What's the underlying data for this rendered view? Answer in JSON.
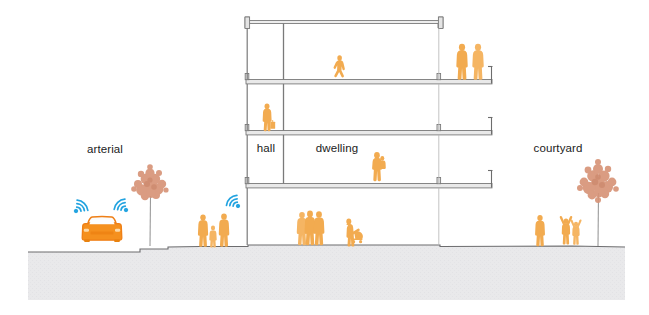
{
  "diagram": {
    "type": "architectural-building-section",
    "title_labels": [
      {
        "id": "arterial",
        "text": "arterial",
        "x": 105,
        "y": 153,
        "anchor": "middle"
      },
      {
        "id": "hall",
        "text": "hall",
        "x": 266,
        "y": 152,
        "anchor": "middle"
      },
      {
        "id": "dwelling",
        "text": "dwelling",
        "x": 337,
        "y": 152,
        "anchor": "middle"
      },
      {
        "id": "courtyard",
        "text": "courtyard",
        "x": 558,
        "y": 152,
        "anchor": "middle"
      }
    ],
    "colors": {
      "figure": "#f2ab50",
      "figure_light": "#f7c87e",
      "car_body": "#f5901e",
      "car_outline": "#ef7f16",
      "wifi": "#22a3e0",
      "tree_foliage": "#d79478",
      "tree_trunk": "#9a9a9a",
      "ground_fill": "#e8e8ea",
      "ground_line": "#58585a",
      "slab_fill": "#ededed",
      "slab_stroke": "#7a7a7a",
      "background": "#ffffff",
      "text": "#1b1b1b"
    },
    "ground": {
      "top_y": 245,
      "bottom_y": 300,
      "left_x": 28,
      "right_x": 625
    },
    "structure": {
      "left_wall_x": 248,
      "hall_right_x": 284,
      "dwelling_right_x": 440,
      "balcony_right_x": 492,
      "roof_right_x": 443,
      "slab_levels": [
        {
          "id": "roof",
          "y": 20,
          "label": "roof slab"
        },
        {
          "id": "level-3",
          "y": 82,
          "label": "third floor slab"
        },
        {
          "id": "level-2",
          "y": 133,
          "label": "second floor slab"
        },
        {
          "id": "level-1",
          "y": 186,
          "label": "first floor slab"
        }
      ]
    },
    "occupants": {
      "balcony_level_3": 2,
      "dwelling_level_3": 1,
      "hall_level_2": 1,
      "dwelling_level_1": 1,
      "street_group": 3,
      "lobby_group": 3,
      "lobby_stroller": 1,
      "courtyard_group": 3
    },
    "trees": [
      {
        "id": "street-tree",
        "x": 150,
        "ground_y": 246,
        "height": 60,
        "crown_r": 19
      },
      {
        "id": "courtyard-tree",
        "x": 598,
        "ground_y": 246,
        "height": 62,
        "crown_r": 21
      }
    ],
    "wifi_signals": [
      {
        "id": "wifi-left",
        "x": 76,
        "y": 207,
        "dir": "right"
      },
      {
        "id": "wifi-right",
        "x": 121,
        "y": 205,
        "dir": "left"
      },
      {
        "id": "wifi-entry",
        "x": 232,
        "y": 201,
        "dir": "left"
      }
    ],
    "vehicle": {
      "id": "car",
      "x": 102,
      "y": 233,
      "view": "front",
      "color": "#f5901e"
    }
  }
}
